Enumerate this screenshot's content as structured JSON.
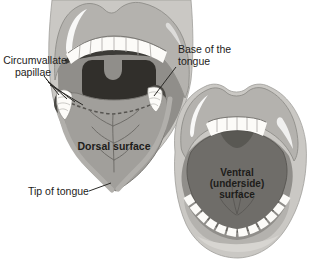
{
  "diagram": {
    "labels": {
      "circumvallate_papillae": {
        "line1": "Circumvallate",
        "line2": "papillae"
      },
      "base_of_tongue": {
        "line1": "Base of the",
        "line2": "tongue"
      },
      "dorsal_surface": "Dorsal surface",
      "tip_of_tongue": "Tip of tongue",
      "ventral_surface": {
        "line1": "Ventral",
        "line2": "(underside)",
        "line3": "surface"
      }
    },
    "colors": {
      "background": "#ffffff",
      "skin": "#cac8c4",
      "lip": "#b4b2ae",
      "lip_outline": "#8f8d89",
      "mouth_interior": "#908e8a",
      "oropharynx": "#312f2b",
      "teeth": "#fcfbf8",
      "tongue_dorsal": "#a19f9b",
      "tongue_ventral": "#6f6d69",
      "leader_line": "#2b2a27",
      "label_text": "#1d1c1a"
    }
  }
}
